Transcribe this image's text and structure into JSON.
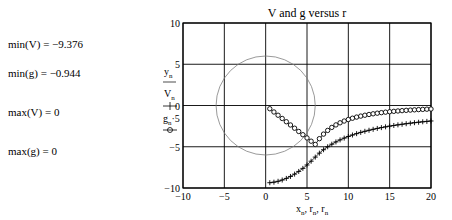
{
  "stats": [
    {
      "label": "min(V) =",
      "value": "−9.376"
    },
    {
      "label": "min(g) =",
      "value": "−0.944"
    },
    {
      "label": "max(V) =",
      "value": "0"
    },
    {
      "label": "max(g) =",
      "value": "0"
    }
  ],
  "stats_text": [
    "min(V) = −9.376",
    "min(g) = −0.944",
    "max(V) = 0",
    "max(g) = 0"
  ],
  "chart_data": {
    "type": "line",
    "title": "V and g versus r",
    "xlabel": "x_n, r_n, r_n",
    "ylabel": [
      "y_n",
      "V_n",
      "g_n·5"
    ],
    "xlim": [
      -10,
      20
    ],
    "ylim": [
      -10,
      10
    ],
    "xticks": [
      -10,
      -5,
      0,
      5,
      10,
      15,
      20
    ],
    "yticks": [
      -10,
      -5,
      0,
      5,
      10
    ],
    "grid": true,
    "sphere_radius": 6,
    "series": [
      {
        "name": "y_n (circle, r = 6)",
        "style": "thin line",
        "color": "#808080",
        "description": "circle of radius ~6 centered at origin"
      },
      {
        "name": "V_n",
        "style": "line with + markers",
        "color": "#000000",
        "x": [
          0.5,
          2,
          4,
          6,
          8,
          10,
          12,
          14,
          16,
          18,
          20
        ],
        "values": [
          -9.38,
          -9.05,
          -8.1,
          -6.27,
          -4.7,
          -3.76,
          -3.13,
          -2.69,
          -2.35,
          -2.09,
          -1.88
        ]
      },
      {
        "name": "g_n·5",
        "style": "line with o markers",
        "color": "#000000",
        "x": [
          0.5,
          2,
          4,
          6,
          8,
          10,
          12,
          14,
          16,
          18,
          20
        ],
        "values": [
          -0.39,
          -1.57,
          -3.15,
          -4.72,
          -2.66,
          -1.7,
          -1.18,
          -0.87,
          -0.66,
          -0.52,
          -0.42
        ]
      }
    ]
  }
}
